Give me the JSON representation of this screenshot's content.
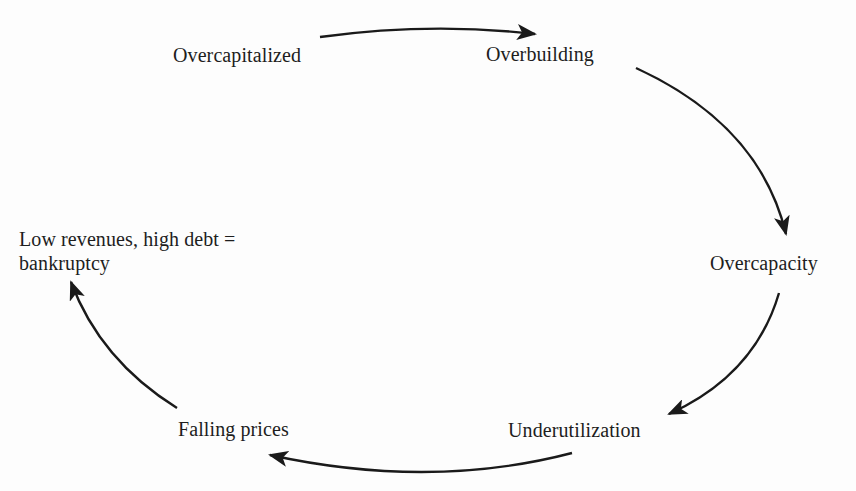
{
  "diagram": {
    "type": "cycle",
    "direction": "clockwise",
    "colors": {
      "text": "#1e1e1e",
      "arrow": "#1a1a1a",
      "background": "#fdfdfd"
    },
    "nodes": [
      {
        "id": "overcapitalized",
        "label": "Overcapitalized"
      },
      {
        "id": "overbuilding",
        "label": "Overbuilding"
      },
      {
        "id": "overcapacity",
        "label": "Overcapacity"
      },
      {
        "id": "underutilization",
        "label": "Underutilization"
      },
      {
        "id": "falling_prices",
        "label": "Falling prices"
      },
      {
        "id": "bankruptcy",
        "label_line1": "Low revenues, high debt =",
        "label_line2": "bankruptcy"
      }
    ],
    "edges": [
      {
        "from": "overcapitalized",
        "to": "overbuilding"
      },
      {
        "from": "overbuilding",
        "to": "overcapacity"
      },
      {
        "from": "overcapacity",
        "to": "underutilization"
      },
      {
        "from": "underutilization",
        "to": "falling_prices"
      },
      {
        "from": "falling_prices",
        "to": "bankruptcy"
      }
    ]
  }
}
